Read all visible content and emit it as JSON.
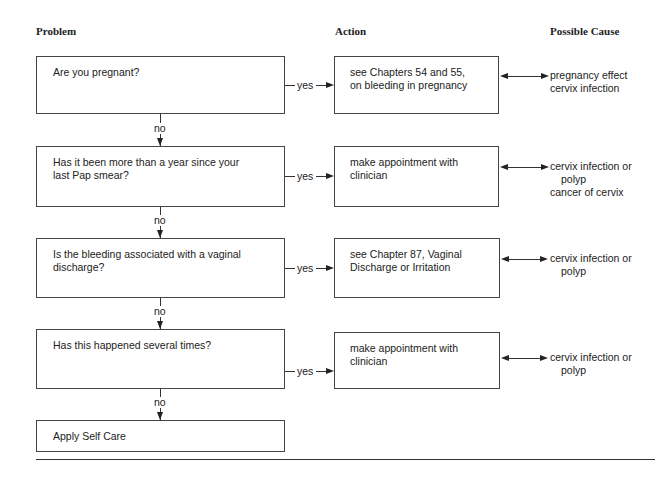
{
  "headers": {
    "problem": "Problem",
    "action": "Action",
    "cause": "Possible Cause"
  },
  "labels": {
    "yes": "yes",
    "no": "no"
  },
  "rows": [
    {
      "question": "Are you pregnant?",
      "action": [
        "see Chapters 54 and 55,",
        "on bleeding in pregnancy"
      ],
      "causes": [
        "pregnancy effect",
        "cervix infection"
      ]
    },
    {
      "question": [
        "Has it been more than a year since your",
        "last Pap smear?"
      ],
      "action": [
        "make appointment with",
        "clinician"
      ],
      "causes": [
        "cervix infection or",
        "polyp",
        "cancer of cervix"
      ]
    },
    {
      "question": [
        "Is the bleeding associated with a vaginal",
        "discharge?"
      ],
      "action": [
        "see Chapter 87, Vaginal",
        "Discharge or Irritation"
      ],
      "causes": [
        "cervix infection or",
        "polyp"
      ]
    },
    {
      "question": "Has this happened several times?",
      "action": [
        "make appointment with",
        "clinician"
      ],
      "causes": [
        "cervix infection or",
        "polyp"
      ]
    }
  ],
  "final": "Apply Self Care"
}
